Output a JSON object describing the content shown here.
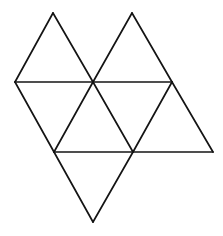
{
  "figure": {
    "title": "Octahedron net of eight equilateral triangles",
    "background_color": "#ffffff",
    "stroke_color": "#141414",
    "stroke_width": 1.7,
    "canvas": {
      "width": 223,
      "height": 236
    },
    "vertices": [
      {
        "id": "A",
        "label": "left-mid",
        "x": 15,
        "y": 82
      },
      {
        "id": "B",
        "label": "top-left-apex",
        "x": 53,
        "y": 13
      },
      {
        "id": "C",
        "label": "center-mid",
        "x": 93,
        "y": 82
      },
      {
        "id": "D",
        "label": "top-right-apex",
        "x": 132,
        "y": 13
      },
      {
        "id": "E",
        "label": "right-mid",
        "x": 172,
        "y": 82
      },
      {
        "id": "F",
        "label": "right-lower",
        "x": 213,
        "y": 152
      },
      {
        "id": "G",
        "label": "bottom-right-node",
        "x": 133,
        "y": 152
      },
      {
        "id": "H",
        "label": "bottom-apex",
        "x": 93,
        "y": 222
      },
      {
        "id": "I",
        "label": "bottom-left-node",
        "x": 54,
        "y": 152
      }
    ],
    "edges": [
      {
        "name": "edge-A-B",
        "path": "M 15 82 L 53 13"
      },
      {
        "name": "edge-B-C",
        "path": "M 53 13 L 93 82"
      },
      {
        "name": "edge-C-D",
        "path": "M 93 82 L 132 13"
      },
      {
        "name": "edge-D-E",
        "path": "M 132 13 L 172 82"
      },
      {
        "name": "edge-A-E-horizontal",
        "path": "M 15 82 L 172 82"
      },
      {
        "name": "edge-E-F",
        "path": "M 172 82 L 213 152"
      },
      {
        "name": "edge-F-G-horizontal",
        "path": "M 213 152 L 54 152"
      },
      {
        "name": "edge-A-I",
        "path": "M 15 82 L 54 152"
      },
      {
        "name": "edge-C-I",
        "path": "M 93 82 L 54 152"
      },
      {
        "name": "edge-C-G",
        "path": "M 93 82 L 133 152"
      },
      {
        "name": "edge-E-G",
        "path": "M 172 82 L 133 152"
      },
      {
        "name": "edge-I-H",
        "path": "M 54 152 L 93 222"
      },
      {
        "name": "edge-G-H",
        "path": "M 133 152 L 93 222"
      }
    ],
    "faces": [
      {
        "name": "triangle-top-left-up",
        "points": "15,82 53,13 93,82"
      },
      {
        "name": "triangle-top-right-up",
        "points": "93,82 132,13 172,82"
      },
      {
        "name": "triangle-upper-left-down",
        "points": "15,82 93,82 54,152"
      },
      {
        "name": "triangle-middle-up",
        "points": "54,152 93,82 133,152"
      },
      {
        "name": "triangle-middle-right-down",
        "points": "93,82 172,82 133,152"
      },
      {
        "name": "triangle-right-up",
        "points": "133,152 172,82 213,152"
      },
      {
        "name": "triangle-bottom-down",
        "points": "54,152 133,152 93,222"
      }
    ],
    "counts": {
      "triangle_count": 7,
      "vertex_count": 9,
      "edge_count": 13
    }
  }
}
